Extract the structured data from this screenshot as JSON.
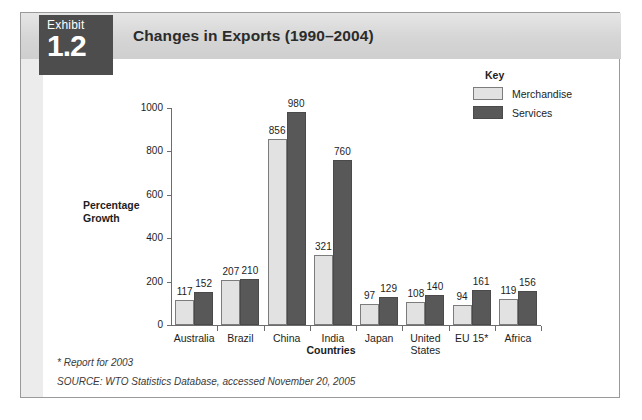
{
  "exhibit": {
    "badge_word": "Exhibit",
    "badge_number": "1.2",
    "title": "Changes in Exports (1990–2004)"
  },
  "legend": {
    "title": "Key",
    "entries": [
      {
        "label": "Merchandise",
        "color": "#e2e2e2"
      },
      {
        "label": "Services",
        "color": "#585858"
      }
    ]
  },
  "footnotes": {
    "asterisk": "* Report for 2003",
    "source": "SOURCE: WTO Statistics Database, accessed November 20, 2005"
  },
  "chart_data": {
    "type": "bar",
    "title": "Changes in Exports (1990–2004)",
    "xlabel": "Countries",
    "ylabel": "Percentage Growth",
    "ylim": [
      0,
      1000
    ],
    "yticks": [
      0,
      200,
      400,
      600,
      800,
      1000
    ],
    "ytick_labels": [
      "0",
      "200",
      "400",
      "600",
      "800",
      "1000"
    ],
    "grid": false,
    "legend_position": "top-right",
    "categories": [
      "Australia",
      "Brazil",
      "China",
      "India",
      "Japan",
      "United States",
      "EU 15*",
      "Africa"
    ],
    "series": [
      {
        "name": "Merchandise",
        "color": "#e2e2e2",
        "values": [
          117,
          207,
          856,
          321,
          97,
          108,
          94,
          119
        ]
      },
      {
        "name": "Services",
        "color": "#585858",
        "values": [
          152,
          210,
          980,
          760,
          129,
          140,
          161,
          156
        ]
      }
    ],
    "annotations": [
      "* Report for 2003",
      "SOURCE: WTO Statistics Database, accessed November 20, 2005"
    ]
  }
}
